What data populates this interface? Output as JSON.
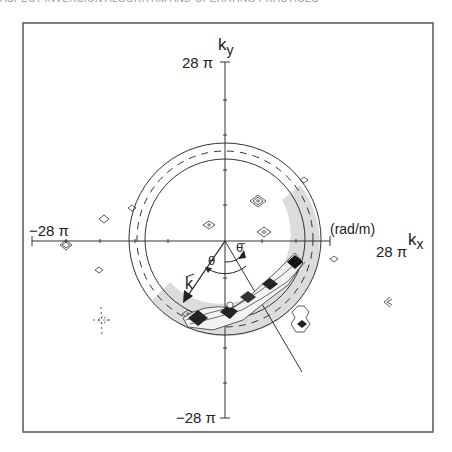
{
  "header": {
    "running_head": "ASPECT INVERSION ALGORITHM AND OPERATING PRACTICES"
  },
  "figure": {
    "y_axis": {
      "label": "k",
      "subscript": "y",
      "max_label": "28 π",
      "min_label": "−28 π"
    },
    "x_axis": {
      "label": "k",
      "subscript": "x",
      "max_label": "28 π",
      "min_label": "−28 π",
      "units": "(rad/m)"
    },
    "vector_label": "k",
    "angle_label": "θ",
    "mean_angle_label": "θ̄",
    "rings": {
      "outer": "solid",
      "middle": "dashed",
      "inner": "solid"
    },
    "colors": {
      "line": "#333333",
      "shade": "#d8d8d8",
      "frame": "#555555",
      "fill_dark": "#222222"
    }
  }
}
